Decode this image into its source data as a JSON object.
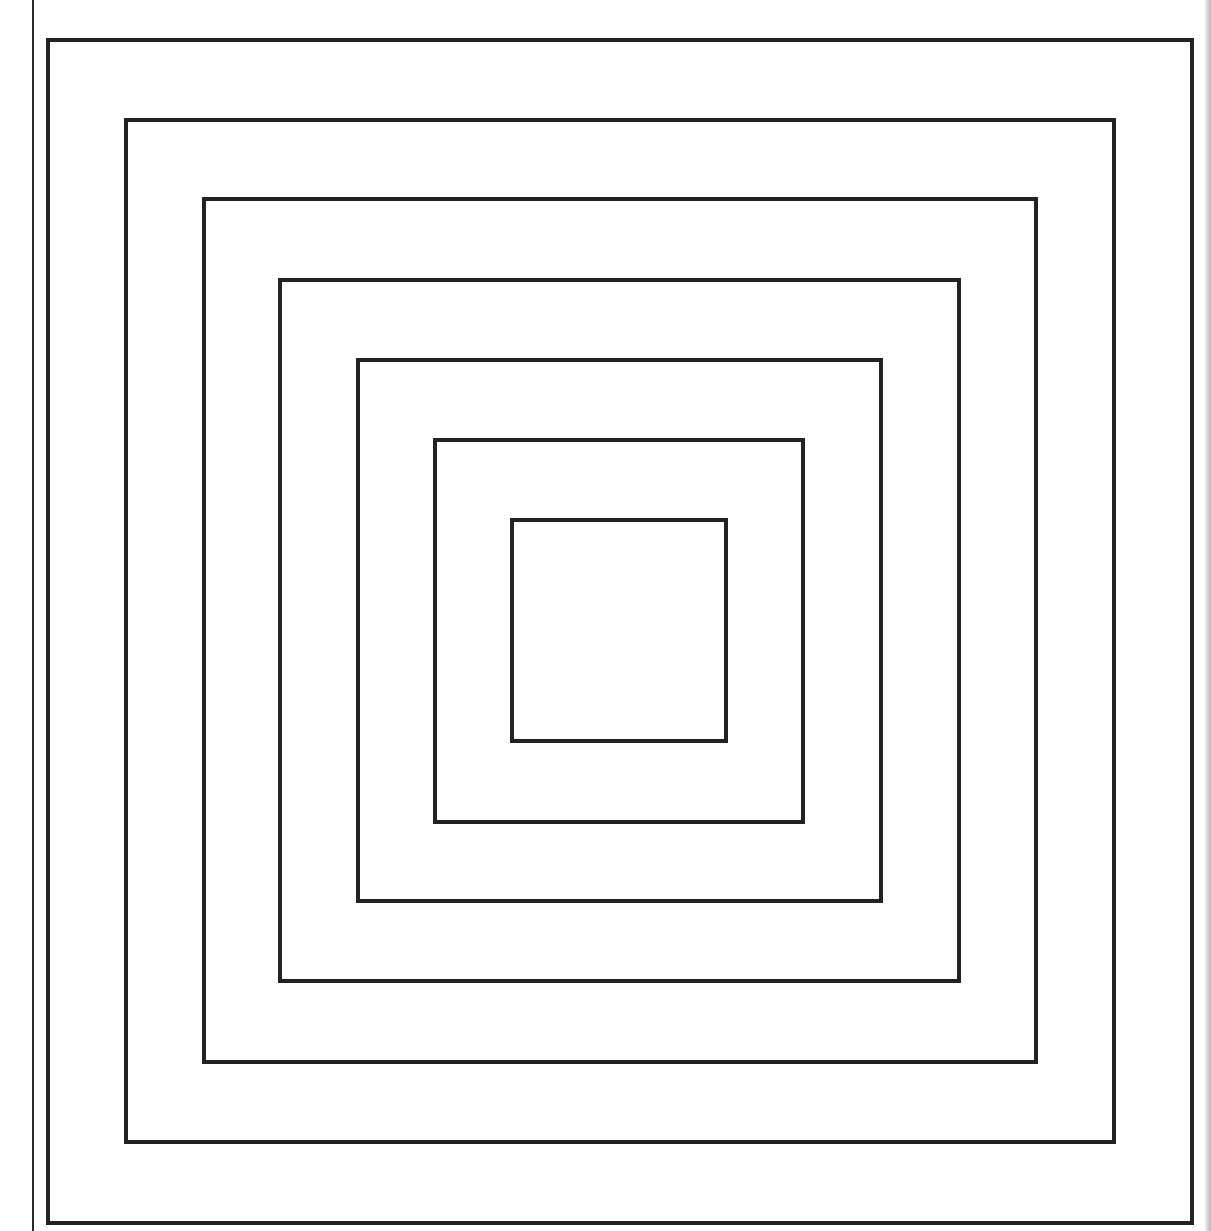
{
  "page": {
    "background": "#ffffff",
    "header_text_clipped": "",
    "margin_rule": {
      "x": 32,
      "color": "#2a2a2a"
    }
  },
  "diagram": {
    "stroke_color": "#222222",
    "stroke_width": 4,
    "square_count": 7,
    "squares": [
      {
        "id": 1,
        "left": 46,
        "top": 38,
        "right": 1194,
        "bottom": 1225
      },
      {
        "id": 2,
        "left": 124,
        "top": 118,
        "right": 1116,
        "bottom": 1144
      },
      {
        "id": 3,
        "left": 202,
        "top": 197,
        "right": 1038,
        "bottom": 1064
      },
      {
        "id": 4,
        "left": 278,
        "top": 278,
        "right": 961,
        "bottom": 983
      },
      {
        "id": 5,
        "left": 356,
        "top": 358,
        "right": 883,
        "bottom": 903
      },
      {
        "id": 6,
        "left": 433,
        "top": 438,
        "right": 805,
        "bottom": 824
      },
      {
        "id": 7,
        "left": 510,
        "top": 518,
        "right": 728,
        "bottom": 743
      }
    ]
  }
}
